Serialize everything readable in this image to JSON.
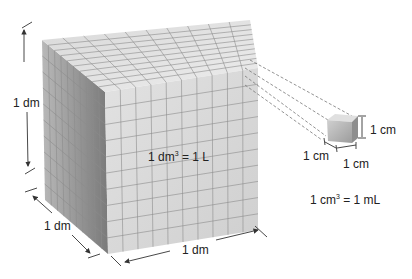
{
  "diagram": {
    "large_cube": {
      "height_label": "1 dm",
      "depth_label": "1 dm",
      "width_label": "1 dm",
      "equation_base": "1 dm",
      "equation_exp": "3",
      "equation_rhs": " = 1 L",
      "grid_divisions": 10
    },
    "small_cube": {
      "height_label": "1 cm",
      "depth_label": "1 cm",
      "width_label": "1 cm",
      "equation_base": "1 cm",
      "equation_exp": "3",
      "equation_rhs": " = 1 mL"
    },
    "colors": {
      "front_face": "#d6d6d6",
      "top_face": "#e4e4e4",
      "side_face": "#9a9a9a",
      "grid_line": "#8c8c8c",
      "dashed_line": "#777777",
      "arrow": "#333333"
    }
  }
}
